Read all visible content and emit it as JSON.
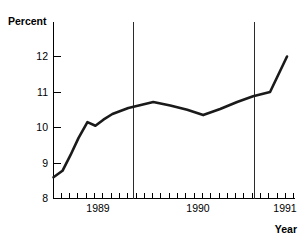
{
  "chart_data": {
    "type": "line",
    "title": "",
    "xlabel": "Year",
    "ylabel": "Percent",
    "ylim": [
      8,
      12.4
    ],
    "yticks": [
      8,
      9,
      10,
      11,
      12
    ],
    "ytick_labels": [
      "8",
      "9",
      "10",
      "11",
      "12"
    ],
    "xlim": [
      1988.58,
      1991.0
    ],
    "xticks": [
      1989,
      1990,
      1991
    ],
    "xtick_labels": [
      "1989",
      "1990",
      "1991"
    ],
    "grid": false,
    "legend": null,
    "x_minor_tick_count": 29,
    "annotations": [
      {
        "type": "vertical-line",
        "x": 1989.58,
        "label": ""
      },
      {
        "type": "vertical-line",
        "x": 1990.75,
        "label": ""
      }
    ],
    "x": [
      1988.58,
      1988.67,
      1988.75,
      1988.83,
      1988.92,
      1989.0,
      1989.08,
      1989.17,
      1989.33,
      1989.58,
      1989.75,
      1989.92,
      1990.08,
      1990.25,
      1990.42,
      1990.58,
      1990.75,
      1990.92
    ],
    "values": [
      8.6,
      8.78,
      9.22,
      9.7,
      10.15,
      10.05,
      10.22,
      10.38,
      10.55,
      10.72,
      10.62,
      10.5,
      10.35,
      10.52,
      10.72,
      10.88,
      11.0,
      12.0
    ],
    "series": [
      {
        "name": "Percent",
        "values": [
          8.6,
          8.78,
          9.22,
          9.7,
          10.15,
          10.05,
          10.22,
          10.38,
          10.55,
          10.72,
          10.62,
          10.5,
          10.35,
          10.52,
          10.72,
          10.88,
          11.0,
          12.0
        ]
      }
    ]
  },
  "labels": {
    "y_axis_title": "Percent",
    "x_axis_title": "Year",
    "y_tick_12": "12",
    "y_tick_11": "11",
    "y_tick_10": "10",
    "y_tick_9": "9",
    "y_tick_8": "8",
    "x_tick_1989": "1989",
    "x_tick_1990": "1990",
    "x_tick_1991": "1991"
  },
  "colors": {
    "line": "#1a1a1a",
    "axis": "#000000",
    "reference_line": "#2b2b2b",
    "background": "#ffffff"
  }
}
